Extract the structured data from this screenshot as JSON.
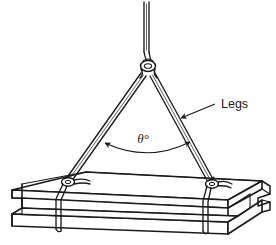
{
  "figure": {
    "type": "technical-line-drawing",
    "background_color": "#ffffff",
    "ink_color": "#1a1a1a"
  },
  "annotations": {
    "legs_label": "Legs",
    "angle_label": "θ°"
  },
  "icons": {
    "leader_arrow": "arrow-head-icon",
    "angle_arc": "double-headed-arc-arrow-icon"
  },
  "geometry": {
    "apex": {
      "x": 148,
      "y": 70
    },
    "left_attachment": {
      "x": 68,
      "y": 181
    },
    "right_attachment": {
      "x": 212,
      "y": 183
    },
    "top_cable_top": {
      "x": 146,
      "y": 2
    },
    "leader_text_anchor": {
      "x": 222,
      "y": 108
    },
    "leader_arrow_tip": {
      "x": 179,
      "y": 119
    },
    "angle_text": {
      "x": 143,
      "y": 140
    }
  }
}
